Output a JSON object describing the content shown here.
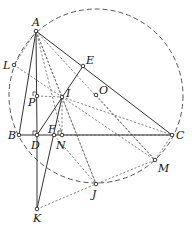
{
  "diagram": {
    "type": "geometry",
    "circle": {
      "name": "circumcircle",
      "center": "O",
      "cx": 96,
      "cy": 96,
      "r": 87
    },
    "points": [
      {
        "id": "A",
        "x": 36,
        "y": 31,
        "label": "A",
        "lx": 32,
        "ly": 26
      },
      {
        "id": "E",
        "x": 83,
        "y": 66,
        "label": "E",
        "lx": 86,
        "ly": 64
      },
      {
        "id": "O",
        "x": 96,
        "y": 95,
        "label": "O",
        "lx": 99,
        "ly": 94
      },
      {
        "id": "L",
        "x": 14,
        "y": 65,
        "label": "L",
        "lx": 3,
        "ly": 69
      },
      {
        "id": "I",
        "x": 62,
        "y": 97,
        "label": "I",
        "lx": 66,
        "ly": 97
      },
      {
        "id": "P",
        "x": 37,
        "y": 96,
        "label": "P",
        "lx": 28,
        "ly": 106
      },
      {
        "id": "B",
        "x": 19,
        "y": 135,
        "label": "B",
        "lx": 8,
        "ly": 139
      },
      {
        "id": "D",
        "x": 37,
        "y": 135,
        "label": "D",
        "lx": 31,
        "ly": 149
      },
      {
        "id": "F",
        "x": 54,
        "y": 135,
        "label": "F",
        "lx": 48,
        "ly": 133
      },
      {
        "id": "N",
        "x": 62,
        "y": 135,
        "label": "N",
        "lx": 56,
        "ly": 149
      },
      {
        "id": "C",
        "x": 172,
        "y": 135,
        "label": "C",
        "lx": 176,
        "ly": 139
      },
      {
        "id": "M",
        "x": 155,
        "y": 160,
        "label": "M",
        "lx": 158,
        "ly": 172
      },
      {
        "id": "J",
        "x": 96,
        "y": 184,
        "label": "J",
        "lx": 92,
        "ly": 198
      },
      {
        "id": "K",
        "x": 37,
        "y": 209,
        "label": "K",
        "lx": 33,
        "ly": 222
      }
    ],
    "solid_segments": [
      [
        "A",
        "B"
      ],
      [
        "A",
        "C"
      ],
      [
        "B",
        "C"
      ],
      [
        "A",
        "D"
      ],
      [
        "D",
        "K"
      ],
      [
        "D",
        "E"
      ],
      [
        "I",
        "K"
      ]
    ],
    "dashed_segments": [
      [
        "A",
        "L"
      ],
      [
        "L",
        "I"
      ],
      [
        "A",
        "I"
      ],
      [
        "A",
        "N"
      ],
      [
        "A",
        "J"
      ],
      [
        "A",
        "M"
      ],
      [
        "P",
        "I"
      ],
      [
        "I",
        "C"
      ],
      [
        "I",
        "N"
      ],
      [
        "I",
        "J"
      ],
      [
        "I",
        "M"
      ],
      [
        "O",
        "M"
      ],
      [
        "C",
        "M"
      ],
      [
        "M",
        "J"
      ],
      [
        "K",
        "J"
      ],
      [
        "N",
        "C"
      ],
      [
        "F",
        "J"
      ]
    ],
    "right_angles": [
      "D",
      "N",
      "P"
    ]
  }
}
